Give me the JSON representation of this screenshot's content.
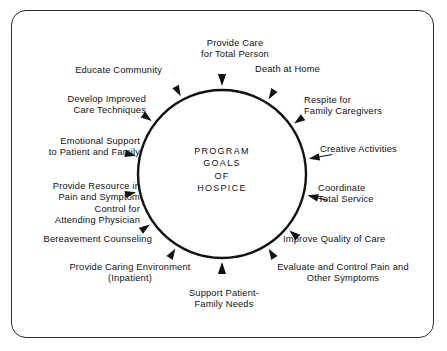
{
  "figure": {
    "title": "Program Goals of Hospice",
    "frame_color": "#2b2b2b",
    "ink_color": "#111111",
    "background": "#ffffff"
  },
  "center": {
    "text": "PROGRAM\nGOALS\nOF\nHOSPICE",
    "lines": [
      "PROGRAM",
      "GOALS",
      "OF",
      "HOSPICE"
    ]
  },
  "diagram": {
    "circle": {
      "cx": 222,
      "cy": 174,
      "r": 84,
      "stroke_width": 2.4
    },
    "arrow_count": 14
  },
  "goals": [
    {
      "id": "provide-care-total-person",
      "text": "Provide Care\nfor Total Person",
      "align": "c",
      "x": 180,
      "y": 38,
      "w": 110,
      "angle": -90
    },
    {
      "id": "death-at-home",
      "text": "Death at Home",
      "align": "l",
      "x": 255,
      "y": 64,
      "w": 110,
      "angle": -58
    },
    {
      "id": "respite-family-caregivers",
      "text": "Respite for\nFamily Caregivers",
      "align": "l",
      "x": 304,
      "y": 95,
      "w": 116,
      "angle": -35
    },
    {
      "id": "creative-activities",
      "text": "Creative Activities",
      "align": "l",
      "x": 320,
      "y": 144,
      "w": 112,
      "angle": -10
    },
    {
      "id": "coordinate-total-service",
      "text": "Coordinate\nTotal Service",
      "align": "l",
      "x": 318,
      "y": 183,
      "w": 104,
      "angle": 14
    },
    {
      "id": "improve-quality-of-care",
      "text": "Improve Quality of Care",
      "align": "l",
      "x": 283,
      "y": 234,
      "w": 142,
      "angle": 40
    },
    {
      "id": "evaluate-control-pain",
      "text": "Evaluate and Control Pain and\nOther Symptoms",
      "align": "c",
      "x": 250,
      "y": 262,
      "w": 186,
      "angle": 58
    },
    {
      "id": "support-patient-family-needs",
      "text": "Support Patient-\nFamily Needs",
      "align": "c",
      "x": 168,
      "y": 288,
      "w": 112,
      "angle": 90
    },
    {
      "id": "provide-caring-environment",
      "text": "Provide Caring Environment\n(Inpatient)",
      "align": "c",
      "x": 45,
      "y": 262,
      "w": 170,
      "angle": 122
    },
    {
      "id": "bereavement-counseling",
      "text": "Bereavement Counseling",
      "align": "r",
      "x": 20,
      "y": 234,
      "w": 132,
      "angle": 145
    },
    {
      "id": "provide-resource-pain-symptom",
      "text": "Provide Resource in\nPain and Symptom\nControl for\nAttending Physician",
      "align": "r",
      "x": 20,
      "y": 181,
      "w": 120,
      "angle": 168
    },
    {
      "id": "emotional-support-patient-family",
      "text": "Emotional Support\nto Patient and Family",
      "align": "r",
      "x": 14,
      "y": 136,
      "w": 126,
      "angle": -168
    },
    {
      "id": "develop-improved-care-techniques",
      "text": "Develop Improved\nCare Techniques",
      "align": "r",
      "x": 28,
      "y": 94,
      "w": 118,
      "angle": -143
    },
    {
      "id": "educate-community",
      "text": "Educate Community",
      "align": "r",
      "x": 50,
      "y": 65,
      "w": 112,
      "angle": -118
    }
  ],
  "arrows": [
    {
      "id": "arrow-provide-care-total-person",
      "angle": -90,
      "size": 12
    },
    {
      "id": "arrow-death-at-home",
      "angle": -58,
      "size": 11
    },
    {
      "id": "arrow-respite-family-caregivers",
      "angle": -35,
      "size": 11
    },
    {
      "id": "arrow-creative-activities",
      "angle": -10,
      "size": 11
    },
    {
      "id": "arrow-coordinate-total-service",
      "angle": 14,
      "size": 11
    },
    {
      "id": "arrow-improve-quality-of-care",
      "angle": 40,
      "size": 11
    },
    {
      "id": "arrow-evaluate-control-pain",
      "angle": 58,
      "size": 11
    },
    {
      "id": "arrow-support-patient-family-needs",
      "angle": 90,
      "size": 12
    },
    {
      "id": "arrow-provide-caring-environment",
      "angle": 122,
      "size": 11
    },
    {
      "id": "arrow-bereavement-counseling",
      "angle": 145,
      "size": 11
    },
    {
      "id": "arrow-provide-resource-pain-symptom",
      "angle": 168,
      "size": 11
    },
    {
      "id": "arrow-emotional-support-patient-family",
      "angle": -168,
      "size": 11
    },
    {
      "id": "arrow-develop-improved-care-techniques",
      "angle": -143,
      "size": 11
    },
    {
      "id": "arrow-educate-community",
      "angle": -118,
      "size": 11
    }
  ],
  "connectors": [
    {
      "id": "connector-creative-activities",
      "angle": -10,
      "length": 13
    },
    {
      "id": "connector-coordinate-total-service",
      "angle": 14,
      "length": 10
    }
  ]
}
